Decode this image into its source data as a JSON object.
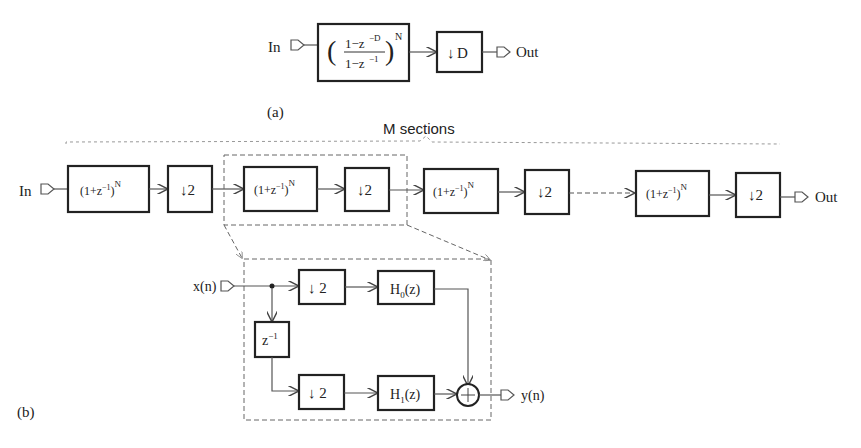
{
  "figure_a": {
    "caption": "(a)",
    "input_label": "In",
    "output_label": "Out",
    "filter_block": {
      "numerator": "1−z",
      "numerator_exp": "−D",
      "denominator": "1−z",
      "denominator_exp": "−1",
      "power": "N"
    },
    "decimator": {
      "arrow": "↓",
      "factor": "D"
    }
  },
  "figure_b": {
    "caption": "(b)",
    "input_label": "In",
    "output_label": "Out",
    "group_label": "M sections",
    "sections": [
      {
        "filter": "(1+z",
        "filter_exp": "−1",
        "filter_close": ")",
        "filter_power": "N",
        "decimator": "↓2"
      },
      {
        "filter": "(1+z",
        "filter_exp": "−1",
        "filter_close": ")",
        "filter_power": "N",
        "decimator": "↓2"
      },
      {
        "filter": "(1+z",
        "filter_exp": "−1",
        "filter_close": ")",
        "filter_power": "N",
        "decimator": "↓2"
      },
      {
        "filter": "(1+z",
        "filter_exp": "−1",
        "filter_close": ")",
        "filter_power": "N",
        "decimator": "↓2"
      }
    ],
    "polyphase": {
      "input_label": "x(n)",
      "output_label": "y(n)",
      "delay": {
        "base": "z",
        "exp": "−1"
      },
      "decimator_top": "↓ 2",
      "decimator_bottom": "↓ 2",
      "h0": {
        "base": "H",
        "sub": "0",
        "arg": "(z)"
      },
      "h1": {
        "base": "H",
        "sub": "1",
        "arg": "(z)"
      },
      "adder": "+"
    }
  }
}
